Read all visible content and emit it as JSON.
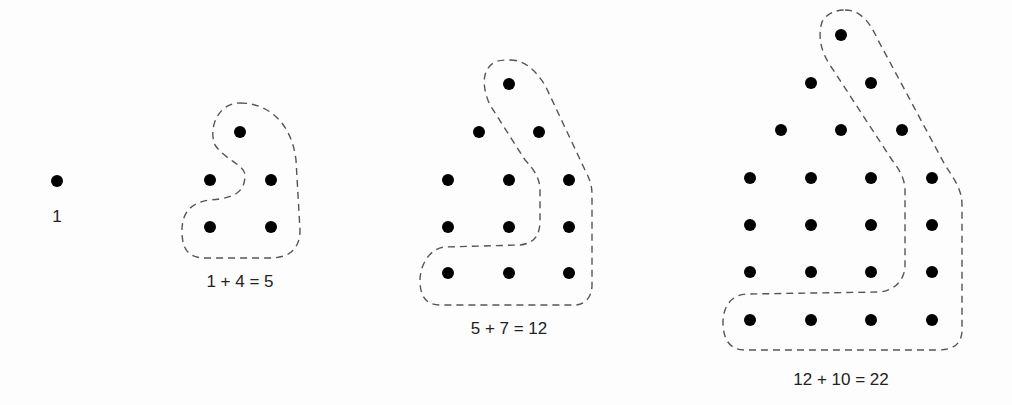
{
  "colors": {
    "dot": "#000000",
    "outline": "#555555",
    "text": "#222222"
  },
  "figures": [
    {
      "id": "p1",
      "label": "1",
      "label_pos": [
        57,
        225
      ],
      "dots": [
        [
          57,
          181
        ]
      ],
      "outline": ""
    },
    {
      "id": "p2",
      "label": "1 + 4 = 5",
      "label_pos": [
        240,
        290
      ],
      "dots": [
        [
          240,
          132
        ],
        [
          210,
          180
        ],
        [
          271,
          180
        ],
        [
          210,
          227
        ],
        [
          271,
          227
        ]
      ],
      "outline": "M240 103 C270 103 292 125 296 160 L300 230 C300 250 288 258 270 258 L205 258 C185 258 182 245 182 230 C182 212 192 202 210 200 C235 198 245 192 245 175 C245 165 225 160 215 145 C208 128 218 103 240 103 Z"
    },
    {
      "id": "p3",
      "label": "5 + 7 = 12",
      "label_pos": [
        509,
        337
      ],
      "dots": [
        [
          509,
          84
        ],
        [
          479,
          132
        ],
        [
          539,
          132
        ],
        [
          448,
          180
        ],
        [
          509,
          180
        ],
        [
          569,
          180
        ],
        [
          448,
          227
        ],
        [
          509,
          227
        ],
        [
          569,
          227
        ],
        [
          448,
          273
        ],
        [
          509,
          273
        ],
        [
          569,
          273
        ]
      ],
      "outline": "M510 60 C525 60 535 70 545 85 L585 170 C590 180 592 185 592 195 L592 285 C592 298 584 305 575 305 L440 305 C425 305 420 295 420 280 C420 265 430 248 445 247 L520 245 C535 243 540 235 540 220 L540 190 C540 180 535 170 525 160 L490 105 C483 90 480 70 495 62 C500 60 505 60 510 60 Z"
    },
    {
      "id": "p4",
      "label": "12 + 10 = 22",
      "label_pos": [
        841,
        385
      ],
      "dots": [
        [
          841,
          35
        ],
        [
          811,
          83
        ],
        [
          871,
          83
        ],
        [
          781,
          130
        ],
        [
          841,
          130
        ],
        [
          902,
          130
        ],
        [
          750,
          178
        ],
        [
          811,
          178
        ],
        [
          871,
          178
        ],
        [
          932,
          178
        ],
        [
          750,
          225
        ],
        [
          811,
          225
        ],
        [
          871,
          225
        ],
        [
          932,
          225
        ],
        [
          750,
          272
        ],
        [
          811,
          272
        ],
        [
          871,
          272
        ],
        [
          932,
          272
        ],
        [
          750,
          320
        ],
        [
          811,
          320
        ],
        [
          871,
          320
        ],
        [
          932,
          320
        ]
      ],
      "outline": "M845 10 C860 10 870 22 878 40 L945 165 C955 180 962 190 962 205 L962 330 C962 345 952 350 938 350 L745 350 C730 350 723 340 723 322 C723 305 733 294 748 294 L880 292 C895 290 905 280 905 265 L905 190 C905 180 900 170 892 160 L830 65 C820 50 818 35 822 22 C826 14 835 10 845 10 Z"
    }
  ]
}
